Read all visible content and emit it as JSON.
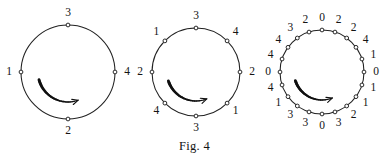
{
  "figure": {
    "caption": "Fig. 4",
    "background_color": "#ffffff",
    "ink_color": "#1a1a1a",
    "arrow_direction": "clockwise",
    "diagrams": [
      {
        "name": "circle-4-points",
        "cx": 68,
        "cy": 72,
        "r": 47,
        "label_offset": 12,
        "point_count": 4,
        "labels_clockwise_from_top": [
          "3",
          "4",
          "2",
          "1"
        ],
        "arrow": {
          "start_angle_deg": 195,
          "end_angle_deg": 290,
          "radius": 30,
          "head_size": 6
        }
      },
      {
        "name": "circle-8-points",
        "cx": 196,
        "cy": 72,
        "r": 44,
        "label_offset": 12,
        "point_count": 8,
        "labels_clockwise_from_top": [
          "3",
          "4",
          "2",
          "1",
          "3",
          "4",
          "2",
          "1"
        ],
        "arrow": {
          "start_angle_deg": 198,
          "end_angle_deg": 292,
          "radius": 29,
          "head_size": 6
        }
      },
      {
        "name": "circle-20-points",
        "cx": 322,
        "cy": 72,
        "r": 42,
        "label_offset": 12,
        "point_count": 20,
        "labels_clockwise_from_top": [
          "0",
          "2",
          "2",
          "4",
          "1",
          "0",
          "1",
          "1",
          "2",
          "3",
          "0",
          "3",
          "3",
          "1",
          "4",
          "0",
          "4",
          "4",
          "3",
          "2"
        ],
        "arrow": {
          "start_angle_deg": 198,
          "end_angle_deg": 292,
          "radius": 28,
          "head_size": 6
        }
      }
    ]
  }
}
